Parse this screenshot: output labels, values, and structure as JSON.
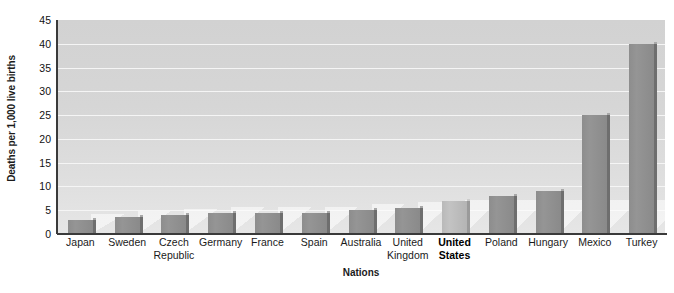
{
  "chart_data": {
    "type": "bar",
    "title": "",
    "xlabel": "Nations",
    "ylabel": "Deaths per 1,000 live births",
    "ylim": [
      0,
      45
    ],
    "ytick_step": 5,
    "yticks": [
      "0",
      "5",
      "10",
      "15",
      "20",
      "25",
      "30",
      "35",
      "40",
      "45"
    ],
    "grid": true,
    "legend": "none",
    "categories": [
      "Japan",
      "Sweden",
      "Czech Republic",
      "Germany",
      "France",
      "Spain",
      "Australia",
      "United Kingdom",
      "United States",
      "Poland",
      "Hungary",
      "Mexico",
      "Turkey"
    ],
    "values": [
      3,
      3.5,
      4,
      4.5,
      4.5,
      4.5,
      5,
      5.5,
      7,
      8,
      9,
      25,
      40
    ],
    "highlight_category": "United States",
    "colors": {
      "bar": "#8f8f8f",
      "bar_highlight": "#bcbcbc",
      "bar_side": "#6e6e6e",
      "plot_background": "#d8d8d8",
      "gridline": "#f5f5f5",
      "axis": "#3a3a3a",
      "text": "#1a1a1a"
    }
  },
  "axes": {
    "y_title": "Deaths per 1,000 live births",
    "x_title": "Nations"
  }
}
